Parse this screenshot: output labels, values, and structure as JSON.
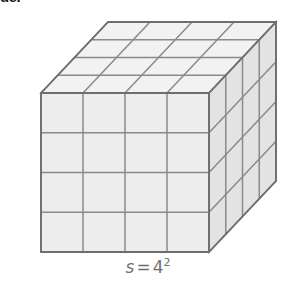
{
  "figure": {
    "name": "cube-4x4x4-oblique-diagram",
    "description_label": "cube-diagram",
    "cropped_heading_text": "de.",
    "caption": {
      "variable": "s",
      "operator": "=",
      "base": "4",
      "exponent": "2",
      "full_text": "s = 4²"
    },
    "geometry": {
      "divisions_per_edge": 4,
      "front_face_grid": "4 x 4",
      "top_face_grid": "4 x 4",
      "right_face_grid": "4 x 4",
      "front_left_x": 41,
      "front_right_x": 209,
      "front_top_y": 93,
      "front_bottom_y": 252,
      "depth_offset_x": 67,
      "depth_offset_y": -71
    },
    "colors": {
      "background": "#ffffff",
      "front_face_fill": "#ededed",
      "top_face_fill": "#f2f2f2",
      "right_face_fill": "#e3e3e3",
      "grid_line": "#8a8a8a",
      "outline": "#777777",
      "caption_text": "#6f6f6f",
      "heading_text": "#1a1a1a"
    }
  }
}
